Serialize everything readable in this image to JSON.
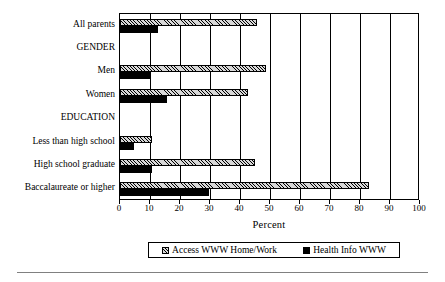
{
  "chart_data": {
    "type": "bar",
    "orientation": "horizontal",
    "title": "",
    "xlabel": "Percent",
    "ylabel": "",
    "xlim": [
      0,
      100
    ],
    "xticks": [
      0,
      10,
      20,
      30,
      40,
      50,
      60,
      70,
      80,
      90,
      100
    ],
    "xticklabels": [
      "0",
      "10",
      "20",
      "30",
      "40",
      "50",
      "60",
      "70",
      "80",
      "90",
      "100"
    ],
    "grid": true,
    "grid_axis": "x",
    "legend_position": "below-axis-title",
    "categories": [
      "All parents",
      "GENDER",
      "Men",
      "Women",
      "EDUCATION",
      "Less than high school",
      "High school graduate",
      "Baccalaureate or higher"
    ],
    "category_is_header": [
      false,
      true,
      false,
      false,
      true,
      false,
      false,
      false
    ],
    "series": [
      {
        "name": "Access WWW Home/Work",
        "pattern": "diagonal-hatch",
        "color": "#d8d8d8",
        "values": [
          45.5,
          null,
          48.5,
          42.5,
          null,
          10.5,
          45.0,
          83.0
        ]
      },
      {
        "name": "Health Info WWW",
        "pattern": "solid",
        "color": "#000000",
        "values": [
          12.5,
          null,
          10.0,
          15.5,
          null,
          4.5,
          10.5,
          29.5
        ]
      }
    ]
  },
  "legend": {
    "entries": [
      {
        "label": "Access WWW Home/Work"
      },
      {
        "label": "Health Info WWW"
      }
    ]
  },
  "axis": {
    "x_title": "Percent"
  }
}
